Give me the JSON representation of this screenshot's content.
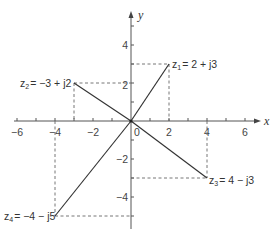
{
  "diagram": {
    "axes": {
      "x_label": "x",
      "y_label": "y",
      "origin_label": "0",
      "x_ticks": [
        {
          "value": -6,
          "label": "−6"
        },
        {
          "value": -4,
          "label": "−4"
        },
        {
          "value": -2,
          "label": "−2"
        },
        {
          "value": 2,
          "label": "2"
        },
        {
          "value": 4,
          "label": "4"
        },
        {
          "value": 6,
          "label": "6"
        }
      ],
      "y_ticks": [
        {
          "value": 4,
          "label": "4"
        },
        {
          "value": 2,
          "label": "2"
        },
        {
          "value": -2,
          "label": "−2"
        },
        {
          "value": -4,
          "label": "−4"
        }
      ],
      "x_range": [
        -6.8,
        6.8
      ],
      "y_range": [
        -5.6,
        5.8
      ]
    },
    "points": [
      {
        "name": "z1",
        "sub": "1",
        "expr": "= 2 + j3",
        "re": 2,
        "im": 3
      },
      {
        "name": "z2",
        "sub": "2",
        "expr": "= −3 + j2",
        "re": -3,
        "im": 2
      },
      {
        "name": "z3",
        "sub": "3",
        "expr": "= 4 − j3",
        "re": 4,
        "im": -3
      },
      {
        "name": "z4",
        "sub": "4",
        "expr": "= −4 − j5",
        "re": -4,
        "im": -5
      }
    ],
    "colors": {
      "line": "#333333",
      "axis": "#555555",
      "dash": "#666666"
    }
  }
}
